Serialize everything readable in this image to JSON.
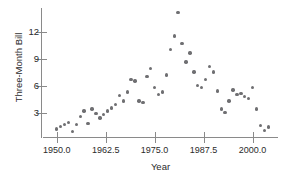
{
  "chart_data": {
    "type": "scatter",
    "title": "",
    "xlabel": "Year",
    "ylabel": "Three-Month Bill",
    "xlim": [
      1946.5,
      2006.5
    ],
    "ylim": [
      0.3,
      14.6
    ],
    "xticks": [
      1950.0,
      1962.5,
      1975.0,
      1987.5,
      2000.0
    ],
    "xtick_labels": [
      "1950.0",
      "1962.5",
      "1975.0",
      "1987.5",
      "2000.0"
    ],
    "yticks": [
      3,
      6,
      9,
      12
    ],
    "ytick_labels": [
      "3",
      "6",
      "9",
      "12"
    ],
    "grid": false,
    "legend": null,
    "marker_color": "#6f6f72",
    "axis_color": "#8a8a8a",
    "x": [
      1950,
      1951,
      1952,
      1953,
      1954,
      1955,
      1956,
      1957,
      1958,
      1959,
      1960,
      1961,
      1962,
      1963,
      1964,
      1965,
      1966,
      1967,
      1968,
      1969,
      1970,
      1971,
      1972,
      1973,
      1974,
      1975,
      1976,
      1977,
      1978,
      1979,
      1980,
      1981,
      1982,
      1983,
      1984,
      1985,
      1986,
      1987,
      1988,
      1989,
      1990,
      1991,
      1992,
      1993,
      1994,
      1995,
      1996,
      1997,
      1998,
      1999,
      2000,
      2001,
      2002,
      2003,
      2004
    ],
    "y": [
      1.2,
      1.5,
      1.7,
      1.9,
      0.9,
      1.7,
      2.6,
      3.2,
      1.8,
      3.4,
      2.9,
      2.4,
      2.8,
      3.2,
      3.5,
      3.9,
      4.9,
      4.3,
      5.3,
      6.7,
      6.5,
      4.3,
      4.1,
      7.0,
      7.9,
      5.8,
      5.0,
      5.3,
      7.2,
      10.0,
      11.5,
      14.1,
      10.7,
      8.6,
      9.6,
      7.5,
      6.0,
      5.8,
      6.7,
      8.1,
      7.5,
      5.4,
      3.4,
      3.0,
      4.3,
      5.5,
      5.0,
      5.1,
      4.8,
      4.6,
      5.8,
      3.4,
      1.6,
      1.0,
      1.4
    ]
  },
  "meta": {
    "x_axis_title": "Year",
    "y_axis_title": "Three-Month Bill"
  }
}
